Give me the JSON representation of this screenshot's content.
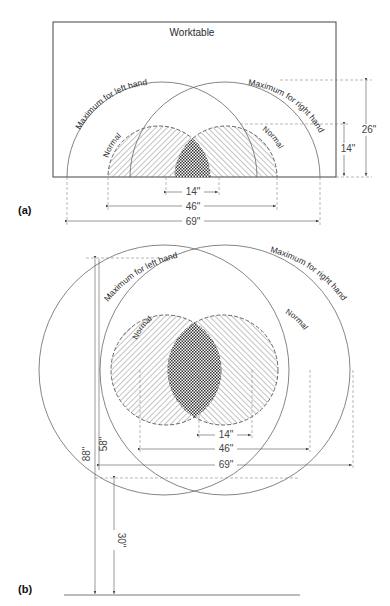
{
  "figure_a": {
    "panel_label": "(a)",
    "title": "Worktable",
    "max_left_label": "Maximum for left hand",
    "max_right_label": "Maximum for right hand",
    "normal_left_label": "Normal",
    "normal_right_label": "Normal",
    "dims": {
      "overlap_width": "14\"",
      "normal_width": "46\"",
      "max_width": "69\"",
      "max_depth": "26\"",
      "normal_depth": "14\""
    }
  },
  "figure_b": {
    "panel_label": "(b)",
    "max_left_label": "Maximum for left hand",
    "max_right_label": "Maximum for right hand",
    "normal_left_label": "Normal",
    "normal_right_label": "Normal",
    "dims": {
      "overlap_width": "14\"",
      "normal_width": "46\"",
      "max_width": "69\"",
      "total_height": "88\"",
      "reach_height": "58\"",
      "seat_height": "30\""
    }
  },
  "colors": {
    "line": "#555555",
    "hatch": "#666666",
    "text": "#2a2a2a"
  }
}
